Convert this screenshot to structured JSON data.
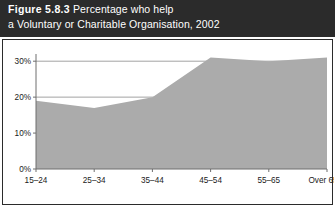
{
  "caption": {
    "figure_number": "Figure 5.8.3",
    "text": "Percentage who help",
    "line2": "a Voluntary or Charitable Organisation, 2002"
  },
  "colors": {
    "caption_background": "#2b2b2b",
    "caption_text": "#ffffff",
    "area_fill": "#ababab",
    "axis": "#6e6e6e",
    "gridline": "#8a8a8a",
    "frame": "#2b2b2b",
    "plot_background": "#ffffff"
  },
  "chart_data": {
    "type": "area",
    "title": "Figure 5.8.3 Percentage who help a Voluntary or Charitable Organisation, 2002",
    "xlabel": "",
    "ylabel": "",
    "categories": [
      "15–24",
      "25–34",
      "35–44",
      "45–54",
      "55–65",
      "Over 65"
    ],
    "values": [
      19,
      17,
      20,
      31,
      30,
      31
    ],
    "ylim": [
      0,
      32
    ],
    "yticks": [
      0,
      10,
      20,
      30
    ],
    "ytick_labels": [
      "0%",
      "10%",
      "20%",
      "30%"
    ],
    "grid": true,
    "grid_axis": "y",
    "legend": null
  }
}
